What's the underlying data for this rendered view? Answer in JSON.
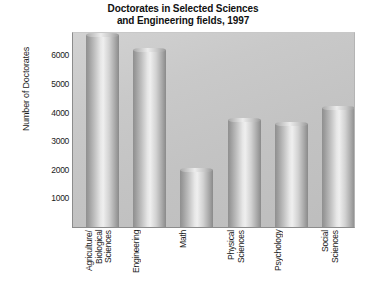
{
  "chart_data": {
    "type": "bar",
    "title": "Doctorates in Selected Sciences and Engineering fields, 1997",
    "title_line1": "Doctorates in Selected Sciences",
    "title_line2": "and Engineering fields, 1997",
    "xlabel": "",
    "ylabel": "Number of Doctorates",
    "categories": [
      "Agriculture/\nBiological\nSciences",
      "Engineering",
      "Math",
      "Physical\nSciences",
      "Psychology",
      "Social\nSciences"
    ],
    "values": [
      6700,
      6200,
      2000,
      3750,
      3600,
      4150
    ],
    "ylim": [
      0,
      6850
    ],
    "yticks": [
      1000,
      2000,
      3000,
      4000,
      5000,
      6000
    ],
    "ytick_labels": [
      "1000",
      "2000",
      "3000",
      "4000",
      "5000",
      "6000"
    ],
    "grid": false,
    "legend": false,
    "bar_style": "cylinder-3d-grayscale",
    "colors": {
      "plot_background": "#c6c6c6",
      "bar_light": "#efefef",
      "bar_dark": "#8a8a8a",
      "axis": "#6e6e6e",
      "text": "#1b1b1b",
      "page_background": "#ffffff"
    }
  }
}
